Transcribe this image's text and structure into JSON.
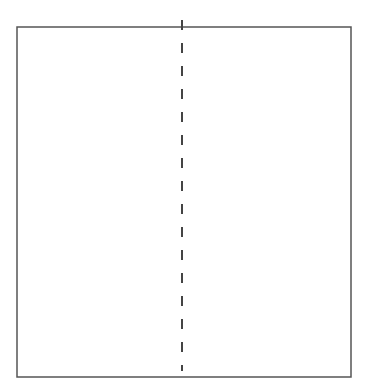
{
  "diagram": {
    "canvas": {
      "width": 368,
      "height": 392,
      "background": "#ffffff"
    },
    "rectangle": {
      "x": 17,
      "y": 27,
      "width": 334,
      "height": 350,
      "stroke": "#555555",
      "stroke_width": 1.5,
      "fill": "#ffffff"
    },
    "divider": {
      "style": "dashed",
      "x": 182,
      "y1": 20,
      "y2": 371,
      "stroke": "#444444",
      "stroke_width": 2,
      "dash": "10 13"
    }
  }
}
